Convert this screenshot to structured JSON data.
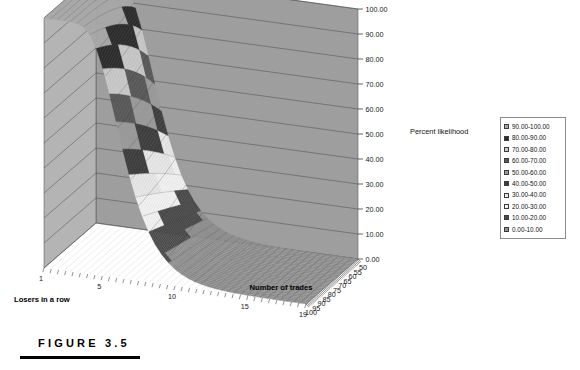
{
  "figure": {
    "caption": "FIGURE 3.5",
    "rule": true
  },
  "chart_data": {
    "type": "surface",
    "title": "",
    "subtitle": "",
    "xlabel": "Number of trades",
    "ylabel": "Losers in a row",
    "zlabel": "Percent likelihood",
    "grid": true,
    "legend_position": "right",
    "x_ticks": [
      "50",
      "55",
      "60",
      "65",
      "70",
      "75",
      "80",
      "85",
      "90",
      "95",
      "100"
    ],
    "y_ticks": [
      "1",
      "5",
      "10",
      "15",
      "19"
    ],
    "z_ticks": [
      "0.00",
      "10.00",
      "20.00",
      "30.00",
      "40.00",
      "50.00",
      "60.00",
      "70.00",
      "80.00",
      "90.00",
      "100.00"
    ],
    "zlim": [
      0,
      100
    ],
    "xlim": [
      50,
      100
    ],
    "ylim": [
      1,
      19
    ],
    "bands": [
      {
        "label": "90.00-100.00",
        "low": 90,
        "high": 100,
        "color": "#a8a8a8"
      },
      {
        "label": "80.00-90.00",
        "low": 80,
        "high": 90,
        "color": "#2b2b2b"
      },
      {
        "label": "70.00-80.00",
        "low": 70,
        "high": 80,
        "color": "#c9c9c9"
      },
      {
        "label": "60.00-70.00",
        "low": 60,
        "high": 70,
        "color": "#585858"
      },
      {
        "label": "50.00-60.00",
        "low": 50,
        "high": 60,
        "color": "#9a9a9a"
      },
      {
        "label": "40.00-50.00",
        "low": 40,
        "high": 50,
        "color": "#3d3d3d"
      },
      {
        "label": "30.00-40.00",
        "low": 30,
        "high": 40,
        "color": "#e8e8e8"
      },
      {
        "label": "20.00-30.00",
        "low": 20,
        "high": 30,
        "color": "#f2f2f2"
      },
      {
        "label": "10.00-20.00",
        "low": 10,
        "high": 20,
        "color": "#4a4a4a"
      },
      {
        "label": "0.00-10.00",
        "low": 0,
        "high": 10,
        "color": "#8f8f8f"
      }
    ]
  },
  "legend": {
    "items": [
      {
        "label": "90.00-100.00",
        "color": "#a8a8a8"
      },
      {
        "label": "80.00-90.00",
        "color": "#2b2b2b"
      },
      {
        "label": "70.00-80.00",
        "color": "#c9c9c9"
      },
      {
        "label": "60.00-70.00",
        "color": "#585858"
      },
      {
        "label": "50.00-60.00",
        "color": "#9a9a9a"
      },
      {
        "label": "40.00-50.00",
        "color": "#3d3d3d"
      },
      {
        "label": "30.00-40.00",
        "color": "#e8e8e8"
      },
      {
        "label": "20.00-30.00",
        "color": "#f2f2f2"
      },
      {
        "label": "10.00-20.00",
        "color": "#4a4a4a"
      },
      {
        "label": "0.00-10.00",
        "color": "#8f8f8f"
      }
    ]
  },
  "colors": {
    "background": "#ffffff",
    "left_wall": "#b4b4b4",
    "back_wall": "#9e9e9e",
    "gridline": "#4a4a4a",
    "mesh": "#555555",
    "text": "#111111"
  }
}
